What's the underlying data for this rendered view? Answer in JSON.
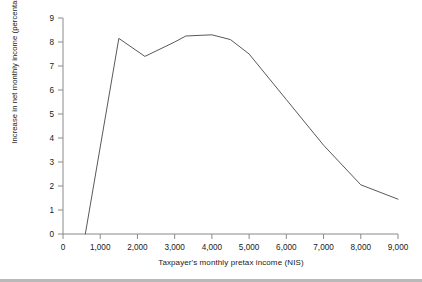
{
  "chart_data": {
    "type": "line",
    "title": "",
    "xlabel": "Taxpayer's monthly pretax income (NIS)",
    "ylabel": "Increase in net monthly income (percentage)",
    "xlim": [
      0,
      9000
    ],
    "ylim": [
      0,
      9
    ],
    "xticks": [
      "0",
      "1,000",
      "2,000",
      "3,000",
      "4,000",
      "5,000",
      "6,000",
      "7,000",
      "8,000",
      "9,000"
    ],
    "xtick_values": [
      0,
      1000,
      2000,
      3000,
      4000,
      5000,
      6000,
      7000,
      8000,
      9000
    ],
    "yticks": [
      "0",
      "1",
      "2",
      "3",
      "4",
      "5",
      "6",
      "7",
      "8",
      "9"
    ],
    "ytick_values": [
      0,
      1,
      2,
      3,
      4,
      5,
      6,
      7,
      8,
      9
    ],
    "grid": false,
    "legend": null,
    "series": [
      {
        "name": "Increase in net monthly income",
        "color": "#595959",
        "x": [
          600,
          1500,
          2200,
          3000,
          3300,
          4000,
          4500,
          5000,
          6000,
          7000,
          8000,
          9000
        ],
        "values": [
          0,
          8.15,
          7.4,
          8.0,
          8.25,
          8.3,
          8.1,
          7.5,
          5.6,
          3.7,
          2.05,
          1.45
        ]
      }
    ]
  },
  "figure": {
    "axis_color": "#8a8a8a",
    "line_color": "#595959",
    "background": "#ffffff",
    "footer_rule_color": "#b9b9b9"
  }
}
